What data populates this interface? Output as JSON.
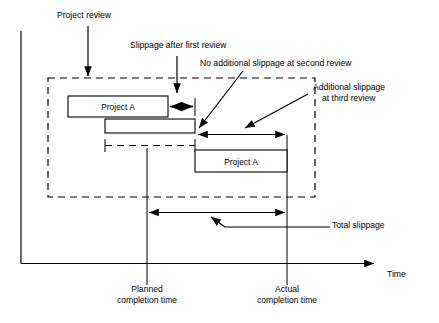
{
  "figure": {
    "type": "project-slippage-gantt-diagram",
    "background_color": "#ffffff",
    "line_color": "#000000"
  },
  "axis": {
    "time_label": "Time",
    "y_axis_name": "vertical-axis",
    "x_axis_name": "time-axis"
  },
  "bars": [
    {
      "label": "Project A",
      "name": "planned-schedule-bar"
    },
    {
      "label": "Project A",
      "name": "actual-schedule-bar"
    }
  ],
  "annotations": {
    "project_review": "Project review",
    "slippage_first": "Slippage after first review",
    "no_additional_slippage": "No additional slippage at second review",
    "additional_slippage_line1": "Additional slippage",
    "additional_slippage_line2": "at third review",
    "total_slippage": "Total slippage"
  },
  "milestones": {
    "planned_line1": "Planned",
    "planned_line2": "completion time",
    "actual_line1": "Actual",
    "actual_line2": "completion time"
  }
}
